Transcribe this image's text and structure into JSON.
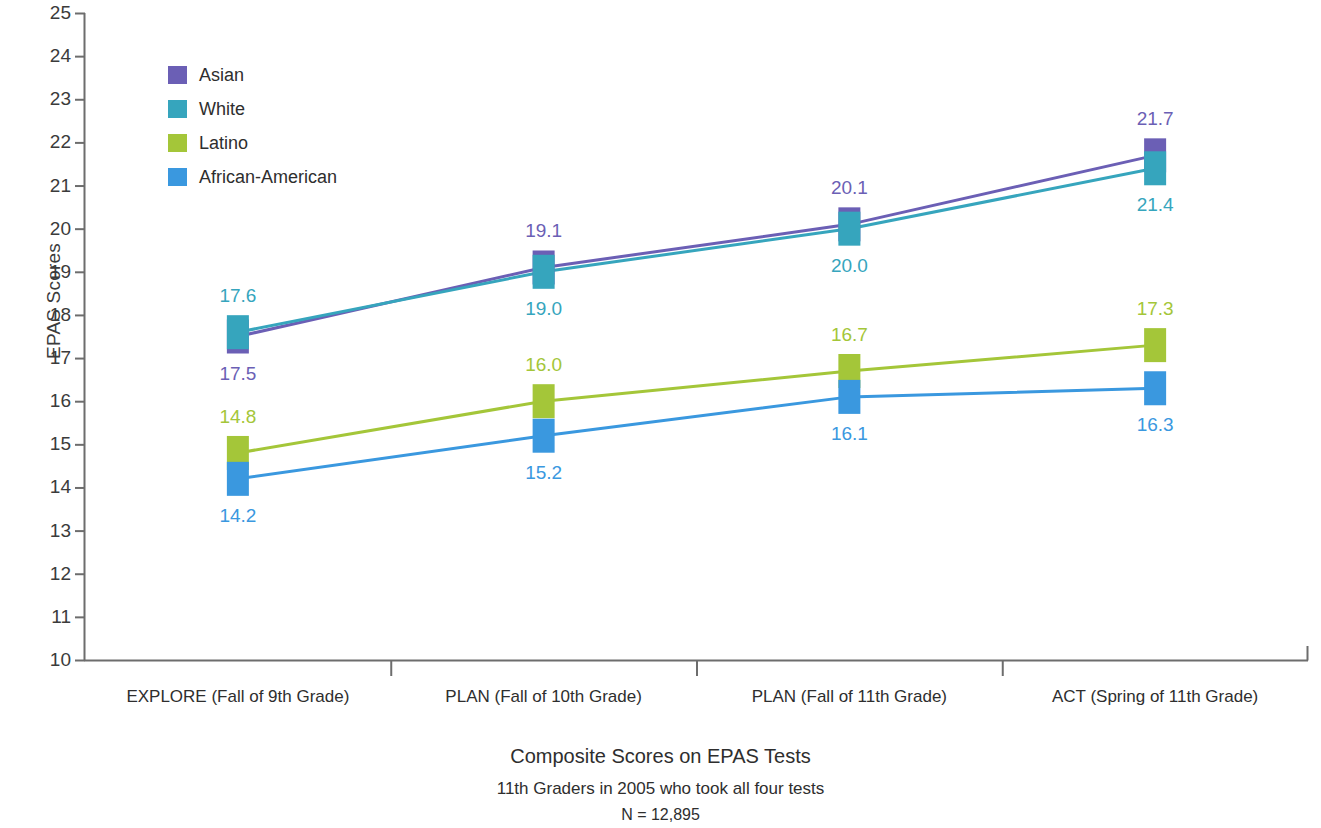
{
  "chart_data": {
    "type": "line",
    "title": "Composite Scores on EPAS Tests",
    "subtitle": "11th Graders in 2005 who took all four tests",
    "note": "N = 12,895",
    "xlabel": "",
    "ylabel": "EPAS Scores",
    "ylim": [
      10,
      25
    ],
    "ytick_step": 1,
    "grid": false,
    "legend_position": "top-left",
    "categories": [
      "EXPLORE (Fall of 9th Grade)",
      "PLAN (Fall of 10th Grade)",
      "PLAN (Fall of 11th Grade)",
      "ACT (Spring of 11th Grade)"
    ],
    "yticks": [
      25,
      24,
      23,
      22,
      21,
      20,
      19,
      18,
      17,
      16,
      15,
      14,
      13,
      12,
      11,
      10
    ],
    "series": [
      {
        "name": "Asian",
        "color": "#6b5fb5",
        "values": [
          17.5,
          19.1,
          20.1,
          21.7
        ],
        "labels": [
          "17.5",
          "19.1",
          "20.1",
          "21.7"
        ],
        "label_side": [
          "below",
          "above",
          "above",
          "above"
        ]
      },
      {
        "name": "White",
        "color": "#36a5bd",
        "values": [
          17.6,
          19.0,
          20.0,
          21.4
        ],
        "labels": [
          "17.6",
          "19.0",
          "20.0",
          "21.4"
        ],
        "label_side": [
          "above",
          "below",
          "below",
          "below"
        ]
      },
      {
        "name": "Latino",
        "color": "#a4c639",
        "values": [
          14.8,
          16.0,
          16.7,
          17.3
        ],
        "labels": [
          "14.8",
          "16.0",
          "16.7",
          "17.3"
        ],
        "label_side": [
          "above",
          "above",
          "above",
          "above"
        ]
      },
      {
        "name": "African-American",
        "color": "#3a98df",
        "values": [
          14.2,
          15.2,
          16.1,
          16.3
        ],
        "labels": [
          "14.2",
          "15.2",
          "16.1",
          "16.3"
        ],
        "label_side": [
          "below",
          "below",
          "below",
          "below"
        ]
      }
    ]
  },
  "legend": {
    "items": [
      {
        "label": "Asian",
        "color": "#6b5fb5"
      },
      {
        "label": "White",
        "color": "#36a5bd"
      },
      {
        "label": "Latino",
        "color": "#a4c639"
      },
      {
        "label": "African-American",
        "color": "#3a98df"
      }
    ]
  },
  "axis": {
    "y_title": "EPAS Scores"
  },
  "caption": {
    "line1": "Composite Scores on EPAS Tests",
    "line2": "11th Graders in 2005 who took all four tests",
    "line3": "N = 12,895"
  }
}
